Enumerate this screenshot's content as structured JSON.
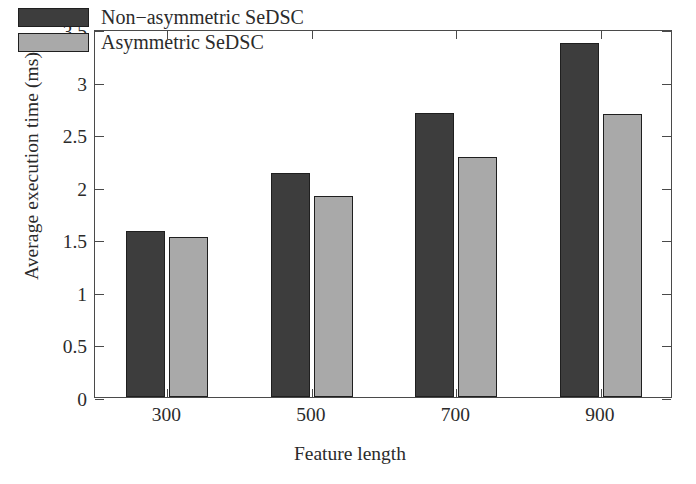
{
  "chart_data": {
    "type": "bar",
    "title": "",
    "xlabel": "Feature length",
    "ylabel": "Average execution time (ms)",
    "categories": [
      "300",
      "500",
      "700",
      "900"
    ],
    "series": [
      {
        "name": "Non−asymmetric SeDSC",
        "color": "#3d3d3d",
        "values": [
          1.58,
          2.13,
          2.7,
          3.37
        ]
      },
      {
        "name": "Asymmetric SeDSC",
        "color": "#a9a9a9",
        "values": [
          1.52,
          1.91,
          2.28,
          2.69
        ]
      }
    ],
    "ylim": [
      0,
      3.5
    ],
    "yticks": [
      "0",
      "0.5",
      "1",
      "1.5",
      "2",
      "2.5",
      "3",
      "3.5"
    ],
    "ytick_values": [
      0,
      0.5,
      1,
      1.5,
      2,
      2.5,
      3,
      3.5
    ],
    "xticks": [
      "300",
      "500",
      "700",
      "900"
    ],
    "grid": false,
    "legend_position": "upper left"
  },
  "legend": {
    "entries": [
      {
        "label": "Non−asymmetric SeDSC"
      },
      {
        "label": "Asymmetric SeDSC"
      }
    ]
  }
}
